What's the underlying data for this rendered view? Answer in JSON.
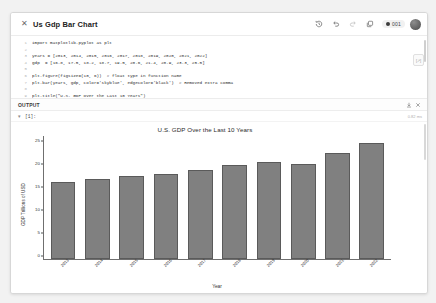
{
  "window": {
    "title": "Us Gdp Bar Chart",
    "close_icon": "close-icon"
  },
  "toolbar": {
    "history_label": "history-icon",
    "undo_label": "undo-icon",
    "redo_label": "redo-icon",
    "copy_label": "copy-icon",
    "status_badge": "001",
    "avatar_label": "avatar"
  },
  "code": {
    "lines": [
      {
        "n": "1",
        "text": "import matplotlib.pyplot as plt"
      },
      {
        "n": "2",
        "text": ""
      },
      {
        "n": "3",
        "text": "years = [2013, 2014, 2015, 2016, 2017, 2018, 2019, 2020, 2021, 2022]"
      },
      {
        "n": "4",
        "text": "gdp  = [16.8, 17.5, 18.2, 18.7, 19.5, 20.6, 21.4, 20.9, 23.3, 25.5]"
      },
      {
        "n": "5",
        "text": ""
      },
      {
        "n": "6",
        "text": "plt.figure(figsize=(10, 6))  # float type in function name"
      },
      {
        "n": "7",
        "text": "plt.bar(years, gdp, color='skyblue', edgecolor='black')  # Removed extra comma"
      },
      {
        "n": "8",
        "text": ""
      },
      {
        "n": "9",
        "text": "plt.title(\"U.S. GDP Over the Last 10 Years\")"
      }
    ],
    "minimap_icon": "expand-icon"
  },
  "output_panel": {
    "label": "OUTPUT",
    "download_icon": "download-icon",
    "close_icon": "close-icon",
    "cell_tag": "[1]:",
    "cell_chevron": "chevron-down-icon",
    "cell_time": "0.82 ms"
  },
  "chart_data": {
    "type": "bar",
    "title": "U.S. GDP Over the Last 10 Years",
    "xlabel": "Year",
    "ylabel": "GDP Trillions of USD",
    "categories": [
      "2013",
      "2014",
      "2015",
      "2016",
      "2017",
      "2018",
      "2019",
      "2020",
      "2021",
      "2022"
    ],
    "values": [
      16.8,
      17.5,
      18.2,
      18.7,
      19.5,
      20.6,
      21.4,
      20.9,
      23.3,
      25.5
    ],
    "yticks": [
      "0",
      "5",
      "10",
      "15",
      "20",
      "25"
    ],
    "ylim": [
      0,
      27
    ],
    "grid": false,
    "legend": "none",
    "bar_color": "#808080",
    "bar_edge_color": "#5a5a5a"
  }
}
